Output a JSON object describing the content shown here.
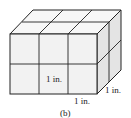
{
  "figure": {
    "caption": "(b)",
    "labels": {
      "front_cube": "1 in.",
      "bottom_edge": "1 in.",
      "depth_edge": "1 in."
    },
    "dimensions": {
      "length": 3,
      "height": 2,
      "depth": 2
    },
    "colors": {
      "front": "#f2f2f2",
      "top": "#f7f7f7",
      "side": "#e4e4e4",
      "stroke": "#222222"
    }
  }
}
